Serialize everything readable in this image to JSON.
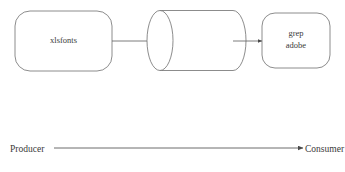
{
  "figure": {
    "type": "pipeline-diagram",
    "background_color": "#ffffff",
    "stroke_color": "#6e6e6e",
    "text_color": "#3a3a3a"
  },
  "nodes": [
    {
      "id": "producer-node",
      "shape": "rounded-rectangle",
      "label": "xlsfonts",
      "lines": [
        "xlsfonts"
      ]
    },
    {
      "id": "pipe-node",
      "shape": "cylinder",
      "label": "",
      "lines": []
    },
    {
      "id": "consumer-node",
      "shape": "rounded-rectangle",
      "label": "grep adobe",
      "lines": [
        "grep",
        "adobe"
      ]
    }
  ],
  "edges": [
    {
      "id": "edge-producer-to-pipe",
      "from": "producer-node",
      "to": "pipe-node",
      "arrow": "arrow-right"
    },
    {
      "id": "edge-pipe-to-consumer",
      "from": "pipe-node",
      "to": "consumer-node",
      "arrow": "arrow-right"
    }
  ],
  "axis": {
    "left_label": "Producer",
    "right_label": "Consumer",
    "arrow": "arrow-right"
  },
  "caption": {
    "text": "",
    "clipped": true
  }
}
